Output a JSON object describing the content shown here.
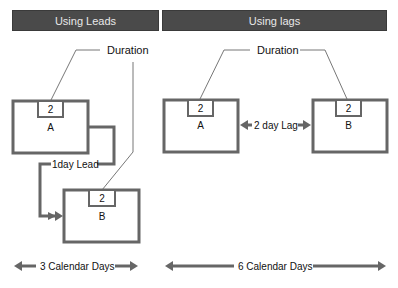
{
  "headers": {
    "left": "Using Leads",
    "right": "Using lags"
  },
  "leads": {
    "duration_label": "Duration",
    "task_a": {
      "name": "A",
      "duration": "2"
    },
    "task_b": {
      "name": "B",
      "duration": "2"
    },
    "lead_label": "1day Lead",
    "span_label": "3 Calendar Days"
  },
  "lags": {
    "duration_label": "Duration",
    "task_a": {
      "name": "A",
      "duration": "2"
    },
    "task_b": {
      "name": "B",
      "duration": "2"
    },
    "lag_label": "2 day Lag",
    "span_label": "6 Calendar Days"
  },
  "colors": {
    "header_bg": "#4a4a4a",
    "box_stroke": "#666666",
    "thin_line": "#777777",
    "text": "#111111"
  }
}
